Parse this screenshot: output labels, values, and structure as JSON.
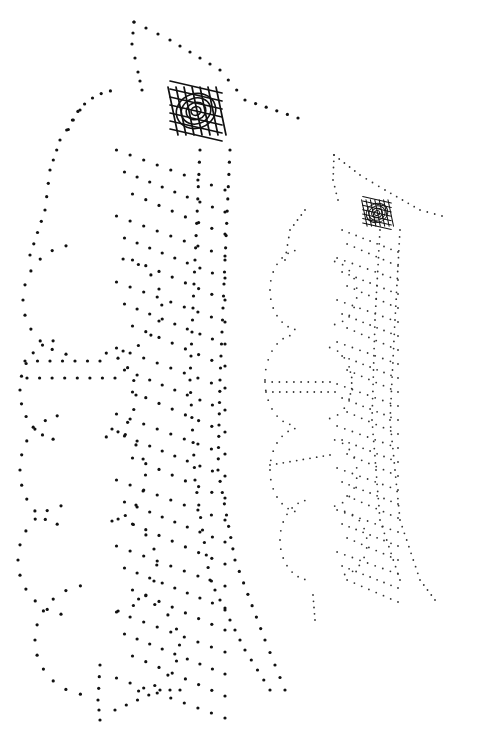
{
  "figure": {
    "background": "#ffffff",
    "patterns": [
      {
        "name": "large-pattern",
        "dot_color": "#111111",
        "dot_radius": 1.6,
        "motif_center": [
          196,
          111
        ],
        "motif_scale": 1.0,
        "offset": [
          0,
          0
        ],
        "scale": 1.0
      },
      {
        "name": "small-pattern",
        "dot_color": "#333333",
        "dot_radius": 0.9,
        "motif_center": [
          377,
          213
        ],
        "motif_scale": 0.55,
        "offset": [
          0,
          0
        ],
        "scale": 1.0
      }
    ]
  }
}
